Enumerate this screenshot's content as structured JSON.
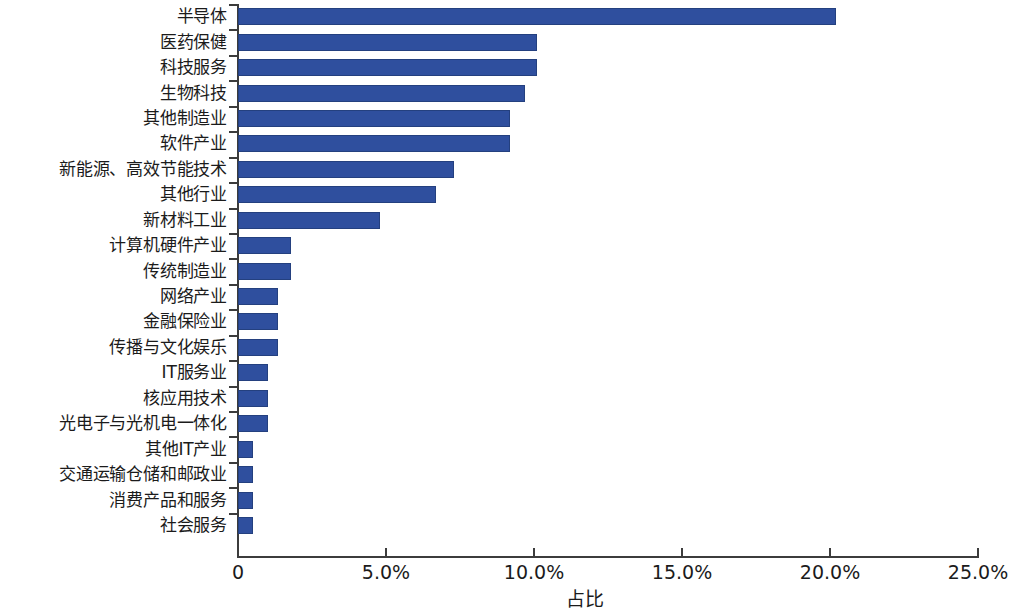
{
  "chart_data": {
    "type": "bar",
    "orientation": "horizontal",
    "title": "",
    "xlabel": "占比",
    "ylabel": "",
    "xlim": [
      0,
      25
    ],
    "grid": false,
    "legend": null,
    "bar_color": "#2f4f9e",
    "xticks": [
      {
        "value": 0,
        "label": "0"
      },
      {
        "value": 5,
        "label": "5.0%"
      },
      {
        "value": 10,
        "label": "10.0%"
      },
      {
        "value": 15,
        "label": "15.0%"
      },
      {
        "value": 20,
        "label": "20.0%"
      },
      {
        "value": 25,
        "label": "25.0%"
      }
    ],
    "categories": [
      "半导体",
      "医药保健",
      "科技服务",
      "生物科技",
      "其他制造业",
      "软件产业",
      "新能源、高效节能技术",
      "其他行业",
      "新材料工业",
      "计算机硬件产业",
      "传统制造业",
      "网络产业",
      "金融保险业",
      "传播与文化娱乐",
      "IT服务业",
      "核应用技术",
      "光电子与光机电一体化",
      "其他IT产业",
      "交通运输仓储和邮政业",
      "消费产品和服务",
      "社会服务"
    ],
    "values": [
      20.2,
      10.1,
      10.1,
      9.7,
      9.2,
      9.2,
      7.3,
      6.7,
      4.8,
      1.8,
      1.8,
      1.35,
      1.35,
      1.35,
      1.0,
      1.0,
      1.0,
      0.5,
      0.5,
      0.5,
      0.5
    ],
    "value_unit": "%"
  }
}
